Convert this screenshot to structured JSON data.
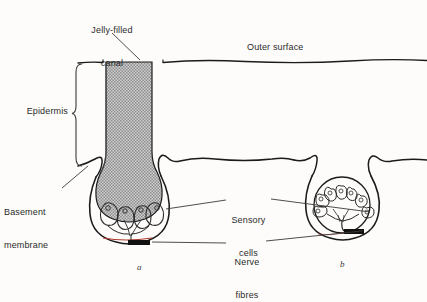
{
  "figure": {
    "kind": "biological-diagram",
    "background_color": "#fdfcfa",
    "ink_color": "#1b1b1b",
    "jelly_fill_color": "#a9a9a9",
    "nerve_color": "#111111",
    "accent_red": "#b03a2e"
  },
  "labels": {
    "jelly_filled_canal": "Jelly-filled\ncanal",
    "jelly_filled_canal_line1": "Jelly-filled",
    "jelly_filled_canal_line2": "canal",
    "outer_surface": "Outer surface",
    "epidermis": "Epidermis",
    "basement_membrane_line1": "Basement",
    "basement_membrane_line2": "membrane",
    "sensory_cells_line1": "Sensory",
    "sensory_cells_line2": "cells",
    "nerve_fibres_line1": "Nerve",
    "nerve_fibres_line2": "fibres"
  },
  "panels": {
    "a": {
      "caption": "a",
      "description": "Ampulla with long jelly-filled canal reaching outer surface",
      "sensory_cell_count": 4
    },
    "b": {
      "caption": "b",
      "description": "Rounded organ with rosette of sensory cells, no long canal",
      "sensory_cell_count": 7
    }
  },
  "structures": [
    {
      "name": "outer-surface-line",
      "kind": "boundary"
    },
    {
      "name": "epidermis-region",
      "kind": "tissue-layer"
    },
    {
      "name": "basement-membrane-line",
      "kind": "boundary"
    },
    {
      "name": "jelly-filled-canal",
      "kind": "canal"
    },
    {
      "name": "ampulla-bulb",
      "kind": "chamber"
    },
    {
      "name": "sensory-cells-a",
      "kind": "cell-group"
    },
    {
      "name": "sensory-cells-b",
      "kind": "cell-group"
    },
    {
      "name": "nerve-fibre-bundle-a",
      "kind": "nerve"
    },
    {
      "name": "nerve-fibre-bundle-b",
      "kind": "nerve"
    }
  ]
}
